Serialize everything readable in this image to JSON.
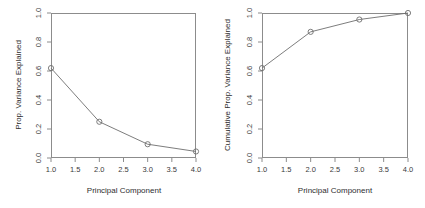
{
  "figure": {
    "background_color": "#ffffff",
    "frame_color": "#8c8c8c",
    "line_color": "#6e6e6e",
    "marker_color": "#6e6e6e",
    "text_color": "#3a3a3a"
  },
  "chart_data": [
    {
      "type": "line",
      "panel": "left",
      "title": "",
      "xlabel": "Principal Component",
      "ylabel": "Prop. Variance Explained",
      "x": [
        1,
        2,
        3,
        4
      ],
      "values": [
        0.62,
        0.25,
        0.095,
        0.045
      ],
      "xlim": [
        1.0,
        4.0
      ],
      "ylim": [
        0.0,
        1.0
      ],
      "xticks": [
        "1.0",
        "1.5",
        "2.0",
        "2.5",
        "3.0",
        "3.5",
        "4.0"
      ],
      "xtick_values": [
        1.0,
        1.5,
        2.0,
        2.5,
        3.0,
        3.5,
        4.0
      ],
      "yticks": [
        "0.0",
        "0.2",
        "0.4",
        "0.6",
        "0.8",
        "1.0"
      ],
      "ytick_values": [
        0.0,
        0.2,
        0.4,
        0.6,
        0.8,
        1.0
      ],
      "grid": false,
      "legend": false,
      "marker": "open-circle"
    },
    {
      "type": "line",
      "panel": "right",
      "title": "",
      "xlabel": "Principal Component",
      "ylabel": "Cumulative Prop. Variance Explained",
      "x": [
        1,
        2,
        3,
        4
      ],
      "values": [
        0.62,
        0.87,
        0.955,
        1.0
      ],
      "xlim": [
        1.0,
        4.0
      ],
      "ylim": [
        0.0,
        1.0
      ],
      "xticks": [
        "1.0",
        "1.5",
        "2.0",
        "2.5",
        "3.0",
        "3.5",
        "4.0"
      ],
      "xtick_values": [
        1.0,
        1.5,
        2.0,
        2.5,
        3.0,
        3.5,
        4.0
      ],
      "yticks": [
        "0.0",
        "0.2",
        "0.4",
        "0.6",
        "0.8",
        "1.0"
      ],
      "ytick_values": [
        0.0,
        0.2,
        0.4,
        0.6,
        0.8,
        1.0
      ],
      "grid": false,
      "legend": false,
      "marker": "open-circle"
    }
  ]
}
